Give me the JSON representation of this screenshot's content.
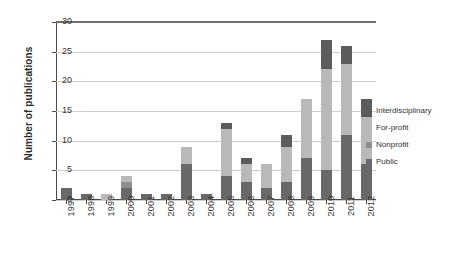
{
  "chart_data": {
    "type": "bar",
    "subtype": "stacked-bar-vertical",
    "title": "",
    "xlabel": "",
    "ylabel": "Number of publications",
    "ylim": [
      0,
      30
    ],
    "yticks": [
      0,
      5,
      10,
      15,
      20,
      25,
      30
    ],
    "grid": true,
    "legend_position": "right",
    "categories": [
      "1997",
      "1998",
      "1999",
      "2000",
      "2001",
      "2002",
      "2003",
      "2004",
      "2005",
      "2006",
      "2007",
      "2008",
      "2009",
      "2010",
      "2011",
      "2012"
    ],
    "series": [
      {
        "name": "Public",
        "color": "#686868",
        "values": [
          2,
          1,
          0,
          2,
          1,
          1,
          6,
          1,
          4,
          3,
          2,
          3,
          7,
          5,
          11,
          6
        ]
      },
      {
        "name": "Nonprofit",
        "color": "#8e8e8e",
        "values": [
          0,
          0,
          0,
          1,
          0,
          0,
          0,
          0,
          0,
          0,
          0,
          0,
          0,
          0,
          0,
          0
        ]
      },
      {
        "name": "For-profit",
        "color": "#b9b9b9",
        "values": [
          0,
          0,
          1,
          1,
          0,
          0,
          3,
          0,
          8,
          3,
          4,
          6,
          10,
          17,
          12,
          8
        ]
      },
      {
        "name": "Interdisciplinary",
        "color": "#5c5c5c",
        "values": [
          0,
          0,
          0,
          0,
          0,
          0,
          0,
          0,
          1,
          1,
          0,
          2,
          0,
          5,
          3,
          3
        ]
      }
    ],
    "totals": [
      2,
      1,
      1,
      4,
      1,
      1,
      9,
      1,
      13,
      7,
      6,
      11,
      17,
      27,
      26,
      17
    ]
  },
  "legend": {
    "items": [
      {
        "label": "Interdisciplinary",
        "key": "interdisciplinary"
      },
      {
        "label": "For-profit",
        "key": "forprofit"
      },
      {
        "label": "Nonprofit",
        "key": "nonprofit"
      },
      {
        "label": "Public",
        "key": "public"
      }
    ]
  },
  "axis": {
    "y_title": "Number of publications"
  }
}
